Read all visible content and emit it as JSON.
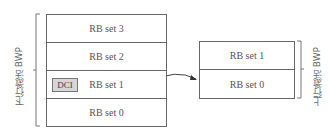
{
  "diagram": {
    "downlink_bwp": {
      "label": "下行激活 BWP",
      "rb_sets": [
        "RB set 3",
        "RB set 2",
        "RB set 1",
        "RB set 0"
      ],
      "dci_label": "DCI",
      "dci_row": "RB set 1"
    },
    "uplink_bwp": {
      "label": "上行激活 BWP",
      "rb_sets": [
        "RB set 1",
        "RB set 0"
      ]
    },
    "arrow": {
      "from": "downlink RB set 1",
      "to": "uplink RB set 0"
    },
    "colors": {
      "border": "#666666",
      "dci_fill": "#d6d6d6",
      "text": "#555555"
    }
  }
}
